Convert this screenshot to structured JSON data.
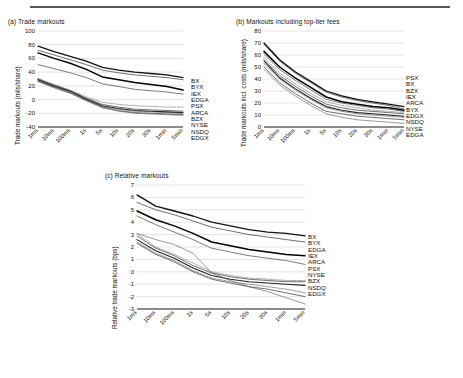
{
  "figure": {
    "background": "#ffffff",
    "rule_color": "#555555",
    "axis_color": "#000000",
    "grid_color": "#c8c8c8"
  },
  "panels": [
    {
      "id": "a",
      "title": "(a) Trade markouts",
      "ylabel": "Trade markouts (mils/share)",
      "legend": [
        "BX",
        "BYX",
        "IEX",
        "EDGA",
        "PSX",
        "ARCA",
        "BZX",
        "NYSE",
        "NSDQ",
        "EDGX"
      ]
    },
    {
      "id": "b",
      "title": "(b) Markouts including top-tier fees",
      "ylabel": "Trade markouts incl. costs (mils/share)",
      "legend": [
        "PSX",
        "BX",
        "BZX",
        "IEX",
        "ARCA",
        "BYX",
        "EDGX",
        "NSDQ",
        "NYSE",
        "EDGA"
      ]
    },
    {
      "id": "c",
      "title": "(c) Relative markouts",
      "ylabel": "Relative trade markouts (bps)",
      "legend": [
        "BX",
        "BYX",
        "EDGA",
        "IEX",
        "ARCA",
        "PSX",
        "NYSE",
        "BZX",
        "NSDQ",
        "EDGX"
      ]
    }
  ],
  "chart_data": [
    {
      "type": "line",
      "panel": "a",
      "title": "(a) Trade markouts",
      "xlabel": "",
      "ylabel": "Trade markouts (mils/share)",
      "x": [
        "1ms",
        "10ms",
        "100ms",
        "1s",
        "5s",
        "10s",
        "20s",
        "30s",
        "1min",
        "5min"
      ],
      "ylim": [
        -40,
        100
      ],
      "yticks": [
        -40,
        -20,
        0,
        20,
        40,
        60,
        80,
        100
      ],
      "grid": true,
      "legend_position": "right",
      "series": [
        {
          "name": "BX",
          "values": [
            78,
            70,
            63,
            56,
            47,
            43,
            40,
            38,
            36,
            32
          ]
        },
        {
          "name": "BYX",
          "values": [
            72,
            65,
            58,
            51,
            43,
            39,
            36,
            34,
            32,
            29
          ]
        },
        {
          "name": "IEX",
          "values": [
            68,
            60,
            53,
            44,
            33,
            29,
            25,
            22,
            19,
            14
          ]
        },
        {
          "name": "EDGA",
          "values": [
            51,
            45,
            39,
            32,
            23,
            19,
            15,
            13,
            11,
            8
          ]
        },
        {
          "name": "PSX",
          "values": [
            31,
            22,
            14,
            4,
            -4,
            -7,
            -9,
            -10,
            -11,
            -11
          ]
        },
        {
          "name": "ARCA",
          "values": [
            30,
            21,
            13,
            2,
            -7,
            -11,
            -14,
            -15,
            -16,
            -17
          ]
        },
        {
          "name": "BZX",
          "values": [
            29,
            20,
            12,
            1,
            -9,
            -13,
            -16,
            -17,
            -18,
            -19
          ]
        },
        {
          "name": "NYSE",
          "values": [
            28,
            19,
            11,
            0,
            -10,
            -14,
            -17,
            -18,
            -19,
            -20
          ]
        },
        {
          "name": "NSDQ",
          "values": [
            27,
            18,
            10,
            -1,
            -11,
            -16,
            -19,
            -20,
            -21,
            -22
          ]
        },
        {
          "name": "EDGX",
          "values": [
            26,
            17,
            9,
            -2,
            -12,
            -17,
            -20,
            -21,
            -22,
            -23
          ]
        }
      ]
    },
    {
      "type": "line",
      "panel": "b",
      "title": "(b) Markouts including top-tier fees",
      "xlabel": "",
      "ylabel": "Trade markouts incl. costs (mils/share)",
      "x": [
        "1ms",
        "10ms",
        "100ms",
        "1s",
        "5s",
        "10s",
        "20s",
        "30s",
        "1min",
        "5min"
      ],
      "ylim": [
        0,
        80
      ],
      "yticks": [
        0,
        10,
        20,
        30,
        40,
        50,
        60,
        70,
        80
      ],
      "grid": true,
      "legend_position": "right",
      "series": [
        {
          "name": "PSX",
          "values": [
            70,
            56,
            46,
            38,
            30,
            26,
            23,
            21,
            19,
            17
          ]
        },
        {
          "name": "BX",
          "values": [
            69,
            55,
            45,
            37,
            29,
            25,
            22,
            20,
            18,
            15
          ]
        },
        {
          "name": "BZX",
          "values": [
            63,
            50,
            41,
            33,
            25,
            21,
            19,
            17,
            16,
            14
          ]
        },
        {
          "name": "IEX",
          "values": [
            61,
            48,
            39,
            31,
            23,
            20,
            18,
            16,
            15,
            13
          ]
        },
        {
          "name": "ARCA",
          "values": [
            58,
            45,
            36,
            28,
            21,
            18,
            16,
            14,
            13,
            12
          ]
        },
        {
          "name": "BYX",
          "values": [
            56,
            43,
            34,
            26,
            19,
            16,
            14,
            13,
            12,
            11
          ]
        },
        {
          "name": "EDGX",
          "values": [
            55,
            41,
            32,
            24,
            17,
            14,
            12,
            11,
            10,
            9
          ]
        },
        {
          "name": "NSDQ",
          "values": [
            53,
            40,
            31,
            23,
            16,
            13,
            11,
            10,
            9,
            8
          ]
        },
        {
          "name": "NYSE",
          "values": [
            50,
            37,
            28,
            20,
            13,
            11,
            9,
            8,
            7,
            6
          ]
        },
        {
          "name": "EDGA",
          "values": [
            48,
            35,
            26,
            18,
            11,
            8,
            6,
            5,
            4,
            3
          ]
        }
      ]
    },
    {
      "type": "line",
      "panel": "c",
      "title": "(c) Relative markouts",
      "xlabel": "",
      "ylabel": "Relative trade markouts (bps)",
      "x": [
        "1ms",
        "10ms",
        "100ms",
        "1s",
        "5s",
        "10s",
        "20s",
        "30s",
        "1min",
        "5min"
      ],
      "ylim": [
        -3,
        7
      ],
      "yticks": [
        -3,
        -2,
        -1,
        0,
        1,
        2,
        3,
        4,
        5,
        6,
        7
      ],
      "grid": true,
      "legend_position": "right",
      "series": [
        {
          "name": "BX",
          "values": [
            6.2,
            5.3,
            4.9,
            4.5,
            4.0,
            3.7,
            3.4,
            3.2,
            3.1,
            2.9
          ]
        },
        {
          "name": "BYX",
          "values": [
            5.6,
            5.0,
            4.6,
            4.1,
            3.6,
            3.3,
            3.0,
            2.8,
            2.6,
            2.4
          ]
        },
        {
          "name": "EDGA",
          "values": [
            4.9,
            4.2,
            3.7,
            3.1,
            2.4,
            2.1,
            1.8,
            1.6,
            1.4,
            1.3
          ]
        },
        {
          "name": "IEX",
          "values": [
            4.5,
            3.8,
            3.2,
            2.6,
            1.9,
            1.6,
            1.3,
            1.1,
            0.9,
            0.6
          ]
        },
        {
          "name": "ARCA",
          "values": [
            3.1,
            2.0,
            1.4,
            0.7,
            0.0,
            -0.3,
            -0.5,
            -0.6,
            -0.7,
            -0.7
          ]
        },
        {
          "name": "PSX",
          "values": [
            2.9,
            1.9,
            1.3,
            0.5,
            -0.1,
            -0.4,
            -0.6,
            -0.7,
            -0.8,
            -0.8
          ]
        },
        {
          "name": "NYSE",
          "values": [
            2.6,
            1.7,
            1.1,
            0.3,
            -0.3,
            -0.6,
            -0.8,
            -0.9,
            -1.0,
            -1.1
          ]
        },
        {
          "name": "BZX",
          "values": [
            2.4,
            1.5,
            0.9,
            0.1,
            -0.5,
            -0.8,
            -1.0,
            -1.2,
            -1.4,
            -1.7
          ]
        },
        {
          "name": "NSDQ",
          "values": [
            2.3,
            1.4,
            0.8,
            0.0,
            -0.6,
            -0.9,
            -1.2,
            -1.4,
            -1.7,
            -2.0
          ]
        },
        {
          "name": "EDGX",
          "values": [
            3.1,
            2.6,
            2.2,
            1.5,
            -0.1,
            -0.7,
            -1.2,
            -1.6,
            -2.1,
            -2.6
          ]
        }
      ]
    }
  ]
}
